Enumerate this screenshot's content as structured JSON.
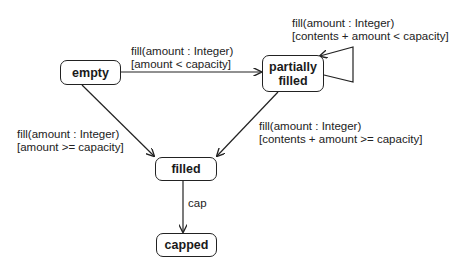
{
  "diagram": {
    "type": "UML state machine",
    "states": {
      "empty": {
        "label": "empty"
      },
      "partially_filled": {
        "line1": "partially",
        "line2": "filled"
      },
      "filled": {
        "label": "filled"
      },
      "capped": {
        "label": "capped"
      }
    },
    "transitions": {
      "empty_to_partial": {
        "event": "fill(amount : Integer)",
        "guard": "[amount < capacity]"
      },
      "partial_self": {
        "event": "fill(amount : Integer)",
        "guard": "[contents + amount < capacity]"
      },
      "empty_to_filled": {
        "event": "fill(amount : Integer)",
        "guard": "[amount >= capacity]"
      },
      "partial_to_filled": {
        "event": "fill(amount : Integer)",
        "guard": "[contents + amount >= capacity]"
      },
      "filled_to_capped": {
        "event": "cap"
      }
    },
    "colors": {
      "line": "#222222",
      "background": "#ffffff"
    }
  }
}
